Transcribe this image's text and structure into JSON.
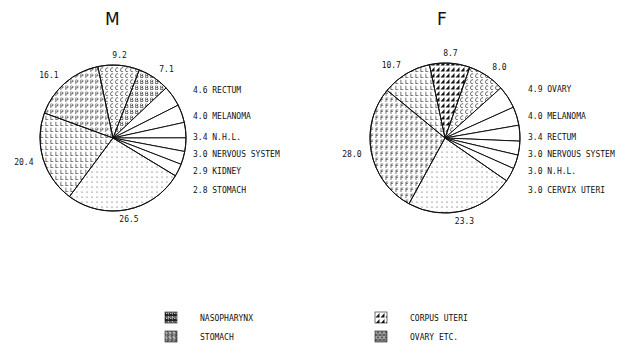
{
  "chart_data": [
    {
      "type": "pie",
      "title": "M",
      "slices": [
        {
          "label": "",
          "value": 9.2,
          "pattern": "C"
        },
        {
          "label": "",
          "value": 7.1,
          "pattern": "B"
        },
        {
          "label": "RECTUM",
          "value": 4.6,
          "pattern": "white"
        },
        {
          "label": "MELANOMA",
          "value": 4.0,
          "pattern": "white"
        },
        {
          "label": "N.H.L.",
          "value": 3.4,
          "pattern": "white"
        },
        {
          "label": "NERVOUS SYSTEM",
          "value": 3.0,
          "pattern": "white"
        },
        {
          "label": "KIDNEY",
          "value": 2.9,
          "pattern": "white"
        },
        {
          "label": "STOMACH",
          "value": 2.8,
          "pattern": "white"
        },
        {
          "label": "",
          "value": 26.5,
          "pattern": "dots"
        },
        {
          "label": "",
          "value": 20.4,
          "pattern": "L"
        },
        {
          "label": "",
          "value": 16.1,
          "pattern": "P"
        }
      ]
    },
    {
      "type": "pie",
      "title": "F",
      "slices": [
        {
          "label": "",
          "value": 8.7,
          "pattern": "tri"
        },
        {
          "label": "",
          "value": 8.0,
          "pattern": "C"
        },
        {
          "label": "OVARY",
          "value": 4.9,
          "pattern": "white"
        },
        {
          "label": "MELANOMA",
          "value": 4.0,
          "pattern": "white"
        },
        {
          "label": "RECTUM",
          "value": 3.4,
          "pattern": "white"
        },
        {
          "label": "NERVOUS SYSTEM",
          "value": 3.0,
          "pattern": "white"
        },
        {
          "label": "N.H.L.",
          "value": 3.0,
          "pattern": "white"
        },
        {
          "label": "CERVIX UTERI",
          "value": 3.0,
          "pattern": "white"
        },
        {
          "label": "",
          "value": 23.3,
          "pattern": "dots"
        },
        {
          "label": "",
          "value": 28.0,
          "pattern": "F"
        },
        {
          "label": "",
          "value": 10.7,
          "pattern": "L"
        }
      ]
    }
  ],
  "legend": [
    {
      "label": "NASOPHARYNX",
      "pattern": "N"
    },
    {
      "label": "STOMACH",
      "pattern": "S"
    },
    {
      "label": "CORPUS UTERI",
      "pattern": "tri"
    },
    {
      "label": "OVARY ETC.",
      "pattern": "O"
    }
  ]
}
